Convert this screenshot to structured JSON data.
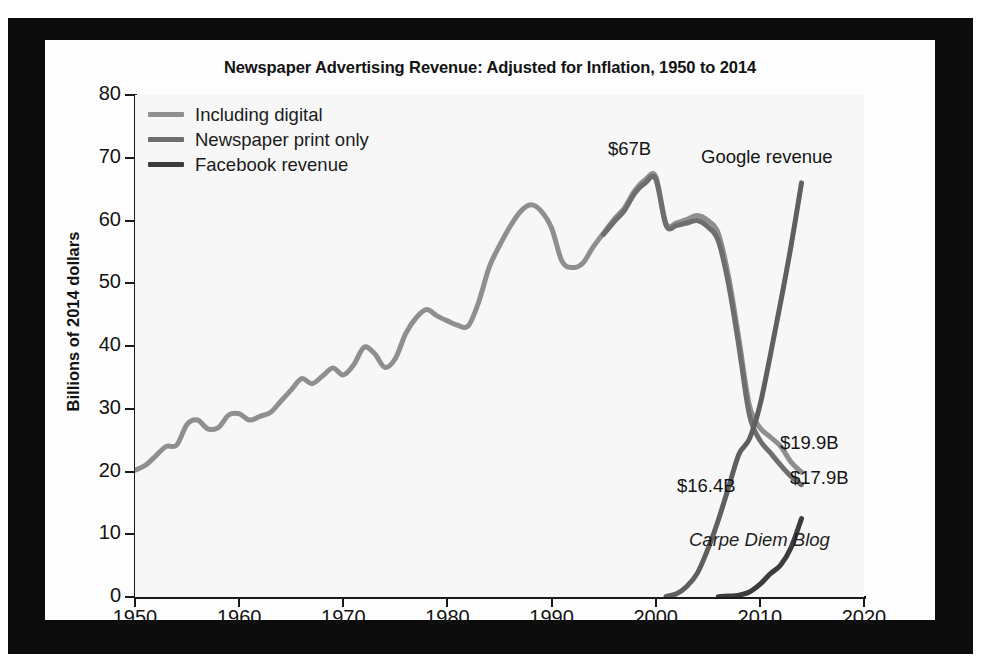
{
  "chart_data": {
    "type": "line",
    "title": "Newspaper Advertising Revenue: Adjusted for Inflation, 1950 to 2014",
    "xlabel": "",
    "ylabel": "Billions of 2014 dollars",
    "xlim": [
      1950,
      2020
    ],
    "ylim": [
      0,
      80
    ],
    "x_ticks": [
      "1950",
      "1960",
      "1970",
      "1980",
      "1990",
      "2000",
      "2010",
      "2020"
    ],
    "y_ticks": [
      "0",
      "10",
      "20",
      "30",
      "40",
      "50",
      "60",
      "70",
      "80"
    ],
    "grid": false,
    "legend_position": "top-left",
    "series": [
      {
        "name": "Including digital",
        "color": "#8f8f8f",
        "x": [
          1950,
          1951,
          1952,
          1953,
          1954,
          1955,
          1956,
          1957,
          1958,
          1959,
          1960,
          1961,
          1962,
          1963,
          1964,
          1965,
          1966,
          1967,
          1968,
          1969,
          1970,
          1971,
          1972,
          1973,
          1974,
          1975,
          1976,
          1977,
          1978,
          1979,
          1980,
          1981,
          1982,
          1983,
          1984,
          1985,
          1986,
          1987,
          1988,
          1989,
          1990,
          1991,
          1992,
          1993,
          1994,
          1995,
          1996,
          1997,
          1998,
          1999,
          2000,
          2001,
          2002,
          2003,
          2004,
          2005,
          2006,
          2007,
          2008,
          2009,
          2010,
          2011,
          2012,
          2013,
          2014
        ],
        "values": [
          20.2,
          21.0,
          22.5,
          24.0,
          24.2,
          27.5,
          28.2,
          26.8,
          27.0,
          29.0,
          29.2,
          28.2,
          28.8,
          29.4,
          31.2,
          33.0,
          34.8,
          34.0,
          35.2,
          36.5,
          35.4,
          37.0,
          39.8,
          38.8,
          36.6,
          38.0,
          42.0,
          44.5,
          45.8,
          44.8,
          44.0,
          43.3,
          43.2,
          47.0,
          52.5,
          56.0,
          59.0,
          61.4,
          62.5,
          61.5,
          58.8,
          53.5,
          52.5,
          53.2,
          55.8,
          58.0,
          60.2,
          62.0,
          64.8,
          66.5,
          67.0,
          59.5,
          59.6,
          60.2,
          60.8,
          60.0,
          58.0,
          51.0,
          41.0,
          30.5,
          27.0,
          25.5,
          24.0,
          21.5,
          19.9
        ]
      },
      {
        "name": "Newspaper print only",
        "color": "#6e6e6e",
        "x": [
          1995,
          1996,
          1997,
          1998,
          1999,
          2000,
          2001,
          2002,
          2003,
          2004,
          2005,
          2006,
          2007,
          2008,
          2009,
          2010,
          2011,
          2012,
          2013,
          2014
        ],
        "values": [
          57.8,
          59.8,
          61.6,
          64.4,
          66.0,
          66.6,
          59.2,
          59.2,
          59.6,
          60.0,
          59.0,
          56.8,
          49.8,
          39.8,
          29.0,
          25.0,
          23.0,
          21.0,
          19.2,
          17.9
        ]
      },
      {
        "name": "Google revenue",
        "color": "#5f5f5f",
        "x": [
          2001,
          2002,
          2003,
          2004,
          2005,
          2006,
          2007,
          2008,
          2009,
          2010,
          2011,
          2012,
          2013,
          2014
        ],
        "values": [
          0.1,
          0.5,
          1.7,
          3.8,
          7.6,
          12.2,
          17.5,
          22.8,
          25.2,
          30.5,
          38.5,
          47.0,
          56.0,
          66.0
        ]
      },
      {
        "name": "Facebook revenue",
        "color": "#3c3c3c",
        "x": [
          2006,
          2007,
          2008,
          2009,
          2010,
          2011,
          2012,
          2013,
          2014
        ],
        "values": [
          0.05,
          0.15,
          0.3,
          0.8,
          2.0,
          3.7,
          5.1,
          7.9,
          12.5
        ]
      }
    ],
    "annotations": [
      {
        "id": "peak",
        "text": "$67B",
        "x": 2000,
        "y": 67.0
      },
      {
        "id": "google",
        "text": "Google revenue",
        "x": 2014,
        "y": 66.0
      },
      {
        "id": "incl",
        "text": "$19.9B",
        "x": 2014,
        "y": 19.9
      },
      {
        "id": "print",
        "text": "$17.9B",
        "x": 2014,
        "y": 17.9
      },
      {
        "id": "fb",
        "text": "$16.4B",
        "x": 2014,
        "y": 16.4
      }
    ],
    "watermark": "Carpe Diem Blog"
  },
  "legend": {
    "items": [
      {
        "label": "Including digital",
        "color": "#8f8f8f"
      },
      {
        "label": "Newspaper print only",
        "color": "#6e6e6e"
      },
      {
        "label": "Facebook revenue",
        "color": "#3c3c3c"
      }
    ]
  },
  "colors": {
    "frame": "#0c0c0c",
    "page": "#fdfdfd",
    "plot_background": "#f7f7f7",
    "axis": "#1a1a1a",
    "text": "#131313"
  }
}
